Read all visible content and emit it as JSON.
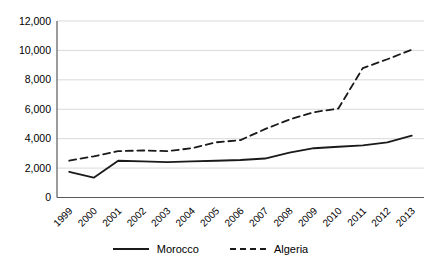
{
  "chart_data": {
    "type": "line",
    "title": "",
    "xlabel": "",
    "ylabel": "",
    "categories": [
      "1999",
      "2000",
      "2001",
      "2002",
      "2003",
      "2004",
      "2005",
      "2006",
      "2007",
      "2008",
      "2009",
      "2010",
      "2011",
      "2012",
      "2013"
    ],
    "series": [
      {
        "name": "Morocco",
        "line_style": "solid",
        "values": [
          1750,
          1350,
          2500,
          2450,
          2400,
          2450,
          2500,
          2550,
          2650,
          3050,
          3350,
          3450,
          3550,
          3750,
          4200
        ]
      },
      {
        "name": "Algeria",
        "line_style": "dashed",
        "values": [
          2500,
          2800,
          3150,
          3200,
          3150,
          3350,
          3750,
          3900,
          4650,
          5300,
          5800,
          6050,
          8800,
          9400,
          10050
        ]
      }
    ],
    "ylim": [
      0,
      12000
    ],
    "ytick_step": 2000,
    "ytick_labels": [
      "0",
      "2,000",
      "4,000",
      "6,000",
      "8,000",
      "10,000",
      "12,000"
    ],
    "grid": true,
    "legend_position": "bottom",
    "colors": {
      "line": "#1a1a1a",
      "grid": "#d9d9d9",
      "axis": "#595959",
      "text": "#000000",
      "background": "#ffffff"
    }
  }
}
